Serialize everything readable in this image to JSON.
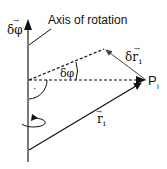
{
  "diagram": {
    "title_label": "Axis of rotation",
    "axis_vector_label": "δφ",
    "angle_label": "δφ",
    "point_label": "P",
    "point_subscript": "i",
    "displacement_label": "δr",
    "displacement_subscript": "i",
    "position_label": "r",
    "position_subscript": "i",
    "right_angle_marker": "·",
    "vector_arrow": "→",
    "colors": {
      "axis": "#7a7a7a",
      "lines": "#111111",
      "background": "#ffffff"
    }
  }
}
